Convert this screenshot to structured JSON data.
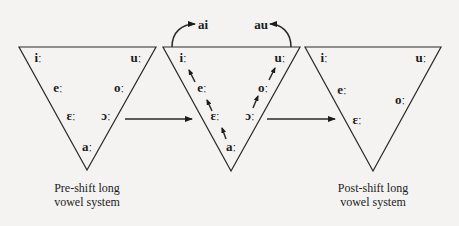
{
  "diagram": {
    "triangles": [
      {
        "id": "pre-shift",
        "vowels": {
          "i": "iː",
          "u": "uː",
          "e": "eː",
          "o": "oː",
          "eps": "ɛː",
          "open_o": "ɔː",
          "a": "aː"
        },
        "caption_line1": "Pre-shift long",
        "caption_line2": "vowel system"
      },
      {
        "id": "shift",
        "vowels": {
          "i": "iː",
          "u": "uː",
          "e": "eː",
          "o": "oː",
          "eps": "ɛː",
          "open_o": "ɔː",
          "a": "aː"
        },
        "diphthongs": {
          "front": "ai",
          "back": "au"
        }
      },
      {
        "id": "post-shift",
        "vowels": {
          "i": "iː",
          "u": "uː",
          "e": "eː",
          "o": "oː",
          "eps": "ɛː"
        },
        "caption_line1": "Post-shift long",
        "caption_line2": "vowel system"
      }
    ],
    "colors": {
      "line": "#2a2a2a",
      "text": "#1c1c1c",
      "background": "#f4f3f1"
    }
  }
}
